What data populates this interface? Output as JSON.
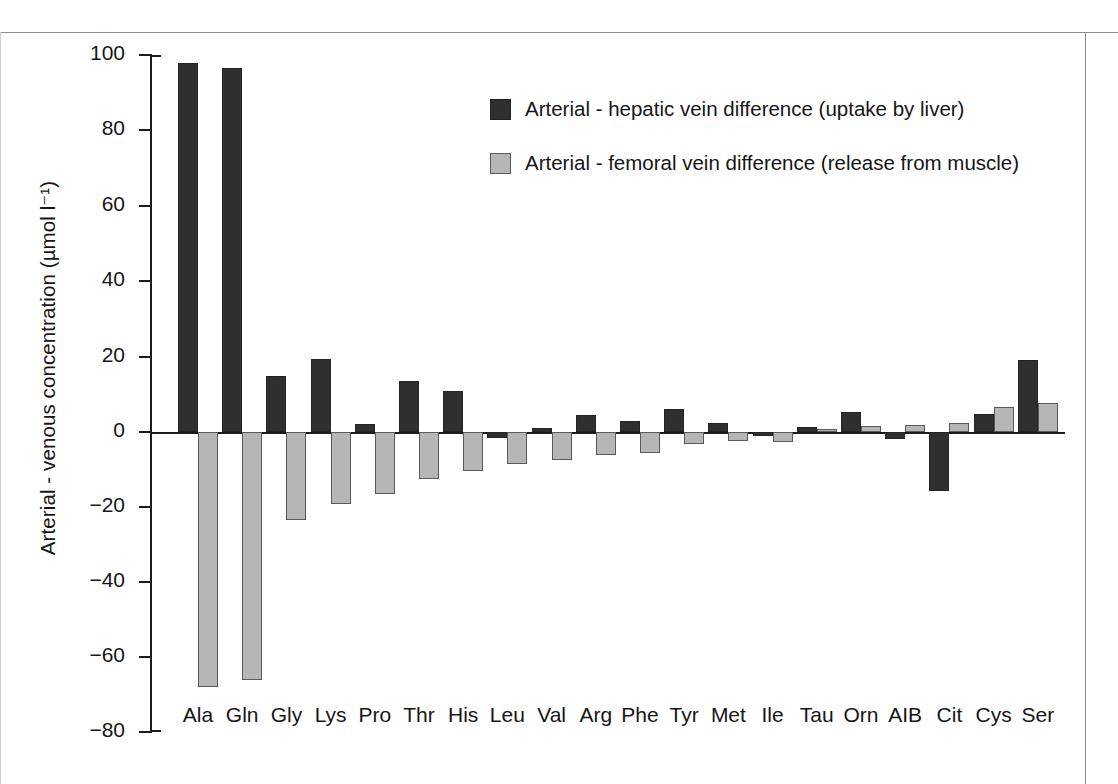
{
  "chart_data": {
    "type": "bar",
    "title": "",
    "xlabel": "",
    "ylabel": "Arterial - venous concentration (µmol l⁻¹)",
    "ylim": [
      -80,
      100
    ],
    "yticks": [
      100,
      80,
      60,
      40,
      20,
      0,
      -20,
      -40,
      -60,
      -80
    ],
    "ytick_labels": [
      "100",
      "80",
      "60",
      "40",
      "20",
      "0",
      "−20",
      "−40",
      "−60",
      "−80"
    ],
    "grid": false,
    "legend_position": "upper center",
    "categories": [
      "Ala",
      "Gln",
      "Gly",
      "Lys",
      "Pro",
      "Thr",
      "His",
      "Leu",
      "Val",
      "Arg",
      "Phe",
      "Tyr",
      "Met",
      "Ile",
      "Tau",
      "Orn",
      "AIB",
      "Cit",
      "Cys",
      "Ser"
    ],
    "series": [
      {
        "name": "Arterial - hepatic vein difference (uptake by liver)",
        "color": "#2f2f2f",
        "values": [
          98,
          96.5,
          14.8,
          19.4,
          2.2,
          13.4,
          10.8,
          -1.6,
          1.1,
          4.5,
          2.8,
          6.2,
          2.4,
          -1.0,
          1.4,
          5.2,
          -1.8,
          -15.6,
          4.8,
          19.2
        ]
      },
      {
        "name": "Arterial - femoral vein difference (release from muscle)",
        "color": "#b6b6b6",
        "values": [
          -68,
          -66,
          -23.4,
          -19.2,
          -16.4,
          -12.6,
          -10.4,
          -8.6,
          -7.4,
          -6.2,
          -5.6,
          -3.2,
          -2.4,
          -2.6,
          0.9,
          1.7,
          1.8,
          2.4,
          6.6,
          7.8
        ]
      }
    ]
  },
  "legend": {
    "items": [
      {
        "swatch": "dark-swatch",
        "label": "Arterial - hepatic vein difference (uptake by liver)"
      },
      {
        "swatch": "light-swatch",
        "label": "Arterial - femoral vein difference (release from muscle)"
      }
    ]
  }
}
